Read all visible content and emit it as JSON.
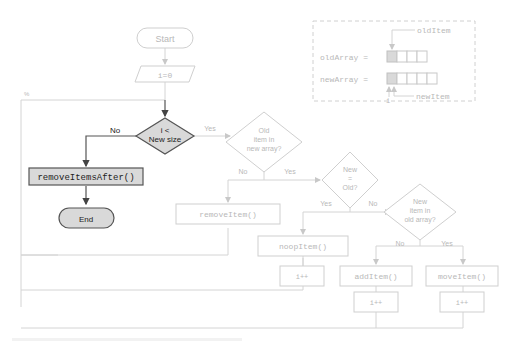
{
  "flowchart": {
    "start": "Start",
    "init": "i=0",
    "loop_condition": [
      "i <",
      "New size"
    ],
    "no_label_main": "No",
    "yes_label_main": "Yes",
    "remove_after": "removeItemsAfter()",
    "end": "End",
    "old_in_new": [
      "Old",
      "item in",
      "new array?"
    ],
    "no_old_in_new": "No",
    "yes_old_in_new": "Yes",
    "remove_item": "removeItem()",
    "new_eq_old": [
      "New",
      "=",
      "Old?"
    ],
    "yes_new_eq_old": "Yes",
    "no_new_eq_old": "No",
    "noop_item": "noopItem()",
    "inc_noop": "i++",
    "new_in_old": [
      "New",
      "item in",
      "old array?"
    ],
    "no_new_in_old": "No",
    "yes_new_in_old": "Yes",
    "add_item": "addItem()",
    "move_item": "moveItem()",
    "inc_add": "i++",
    "inc_move": "i++"
  },
  "legend": {
    "old_item": "oldItem",
    "old_array": "oldArray =",
    "new_array": "newArray =",
    "i_label": "i",
    "new_item": "newItem",
    "old_array_cells": 4,
    "new_array_cells": 5
  },
  "colors": {
    "active_fill": "#d9d9d9",
    "active_stroke": "#555555",
    "faint_stroke": "#cfcfcf",
    "faint_text": "#b8b8b8"
  }
}
